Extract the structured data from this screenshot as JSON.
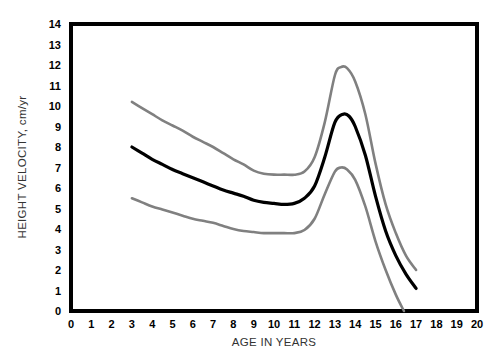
{
  "chart_data": {
    "type": "line",
    "title": "",
    "xlabel": "AGE IN YEARS",
    "ylabel": "HEIGHT VELOCITY, cm/yr",
    "xlim": [
      0,
      20
    ],
    "ylim": [
      0,
      14
    ],
    "xticks": [
      "0",
      "1",
      "2",
      "3",
      "4",
      "5",
      "6",
      "7",
      "8",
      "9",
      "10",
      "11",
      "12",
      "13",
      "14",
      "15",
      "16",
      "17",
      "18",
      "19",
      "20"
    ],
    "yticks": [
      "0",
      "1",
      "2",
      "3",
      "4",
      "5",
      "6",
      "7",
      "8",
      "9",
      "10",
      "11",
      "12",
      "13",
      "14"
    ],
    "grid": false,
    "legend": "none",
    "colors": {
      "mean_curve": "#000000",
      "percentile_curve": "#808080",
      "frame": "#000000",
      "background": "#ffffff"
    },
    "series": [
      {
        "name": "Upper percentile",
        "color": "#808080",
        "x": [
          3,
          3.5,
          4,
          4.5,
          5,
          5.5,
          6,
          6.5,
          7,
          7.5,
          8,
          8.5,
          9,
          9.5,
          10,
          10.5,
          11,
          11.5,
          12,
          12.5,
          13,
          13.3,
          13.6,
          14,
          14.5,
          15,
          15.5,
          16,
          16.5,
          17
        ],
        "values": [
          10.2,
          9.9,
          9.6,
          9.3,
          9.05,
          8.8,
          8.5,
          8.25,
          8.0,
          7.7,
          7.4,
          7.15,
          6.85,
          6.7,
          6.65,
          6.65,
          6.65,
          6.8,
          7.5,
          9.2,
          11.5,
          11.9,
          11.85,
          11.2,
          9.6,
          7.2,
          5.2,
          3.8,
          2.7,
          2.0
        ]
      },
      {
        "name": "Mean",
        "color": "#000000",
        "x": [
          3,
          3.5,
          4,
          4.5,
          5,
          5.5,
          6,
          6.5,
          7,
          7.5,
          8,
          8.5,
          9,
          9.5,
          10,
          10.5,
          11,
          11.5,
          12,
          12.5,
          13,
          13.4,
          13.7,
          14,
          14.5,
          15,
          15.5,
          16,
          16.5,
          17
        ],
        "values": [
          8.0,
          7.7,
          7.4,
          7.15,
          6.9,
          6.7,
          6.5,
          6.3,
          6.1,
          5.9,
          5.75,
          5.6,
          5.4,
          5.3,
          5.25,
          5.2,
          5.25,
          5.5,
          6.1,
          7.5,
          9.2,
          9.6,
          9.5,
          9.0,
          7.6,
          5.6,
          3.9,
          2.7,
          1.8,
          1.1
        ]
      },
      {
        "name": "Lower percentile",
        "color": "#808080",
        "x": [
          3,
          3.5,
          4,
          4.5,
          5,
          5.5,
          6,
          6.5,
          7,
          7.5,
          8,
          8.5,
          9,
          9.5,
          10,
          10.5,
          11,
          11.5,
          12,
          12.5,
          13,
          13.3,
          13.6,
          14,
          14.5,
          15,
          15.5,
          16,
          16.4
        ],
        "values": [
          5.5,
          5.3,
          5.1,
          4.95,
          4.8,
          4.65,
          4.5,
          4.4,
          4.3,
          4.15,
          4.0,
          3.9,
          3.85,
          3.8,
          3.8,
          3.8,
          3.8,
          3.95,
          4.5,
          5.7,
          6.8,
          7.0,
          6.9,
          6.4,
          5.1,
          3.4,
          2.0,
          0.8,
          0.0
        ]
      }
    ]
  }
}
